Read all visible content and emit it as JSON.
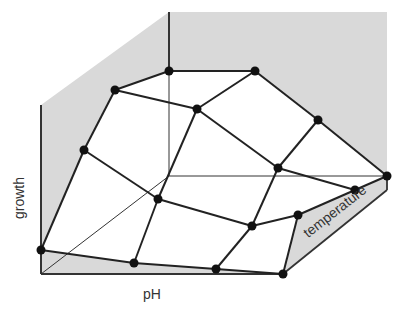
{
  "diagram": {
    "type": "3d-surface-wireframe",
    "axes": {
      "x_label": "pH",
      "y_label": "growth",
      "z_label": "temperature"
    },
    "colors": {
      "wall_fill": "#d9d9d9",
      "line": "#222222",
      "node": "#111111",
      "background": "#ffffff"
    },
    "grid": {
      "rows": 4,
      "cols": 4,
      "nodes": [
        [
          [
            41,
            250
          ],
          [
            134,
            263
          ],
          [
            216,
            269
          ],
          [
            283,
            274
          ]
        ],
        [
          [
            84,
            150
          ],
          [
            158,
            199
          ],
          [
            252,
            226
          ],
          [
            298,
            215
          ]
        ],
        [
          [
            115,
            90
          ],
          [
            197,
            109
          ],
          [
            278,
            168
          ],
          [
            355,
            190
          ]
        ],
        [
          [
            169,
            71
          ],
          [
            255,
            71
          ],
          [
            318,
            120
          ],
          [
            387,
            176
          ]
        ]
      ]
    }
  }
}
